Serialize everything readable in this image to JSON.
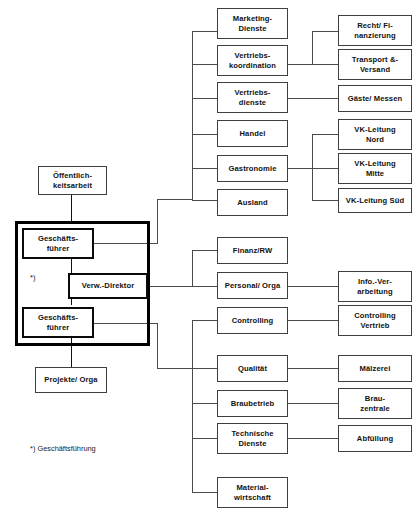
{
  "diagram": {
    "background": "#ffffff",
    "line_color": "#4a4a4a",
    "box_border": "#3f3f3f",
    "emphasis_border": "#000000"
  },
  "left": {
    "public_relations": "Öffentlich-\nkeitsarbeit",
    "managing_director_top": "Geschäfts-\nführer",
    "managing_director_bottom": "Geschäfts-\nführer",
    "admin_director": "Verw.-Direktor",
    "projects": "Projekte/ Orga",
    "footnote_marker": "*)",
    "footnote_text": "*) Geschäftsführung"
  },
  "group_sales": {
    "nodes": [
      {
        "id": "marketing-dienste",
        "label": "Marketing-\nDienste"
      },
      {
        "id": "vertriebskoordination",
        "label": "Vertriebs-\nkoordination"
      },
      {
        "id": "vertriebsdienste",
        "label": "Vertriebs-\ndienste"
      },
      {
        "id": "handel",
        "label": "Handel"
      },
      {
        "id": "gastronomie",
        "label": "Gastronomie"
      },
      {
        "id": "ausland",
        "label": "Ausland"
      }
    ],
    "children": [
      {
        "id": "recht-finanzierung",
        "label": "Recht/ Fi-\nnanzierung"
      },
      {
        "id": "transport-versand",
        "label": "Transport &-\nVersand"
      },
      {
        "id": "gaeste-messen",
        "label": "Gäste/ Messen"
      },
      {
        "id": "vk-leitung-nord",
        "label": "VK-Leitung\nNord"
      },
      {
        "id": "vk-leitung-mitte",
        "label": "VK-Leitung\nMitte"
      },
      {
        "id": "vk-leitung-sued",
        "label": "VK-Leitung Süd"
      }
    ]
  },
  "group_admin": {
    "nodes": [
      {
        "id": "finanz-rw",
        "label": "Finanz/RW"
      },
      {
        "id": "personal-orga",
        "label": "Personal/ Orga"
      },
      {
        "id": "controlling",
        "label": "Controlling"
      }
    ],
    "children": [
      {
        "id": "info-verarbeitung",
        "label": "Info.-Ver-\narbeitung"
      },
      {
        "id": "controlling-vertrieb",
        "label": "Controlling\nVertrieb"
      }
    ]
  },
  "group_production": {
    "nodes": [
      {
        "id": "qualitaet",
        "label": "Qualität"
      },
      {
        "id": "braubetrieb",
        "label": "Braubetrieb"
      },
      {
        "id": "technische-dienste",
        "label": "Technische\nDienste"
      },
      {
        "id": "materialwirtschaft",
        "label": "Material-\nwirtschaft"
      }
    ],
    "children": [
      {
        "id": "maelzerei",
        "label": "Mälzerei"
      },
      {
        "id": "brau-zentrale",
        "label": "Brau-\nzentrale"
      },
      {
        "id": "abfuellung",
        "label": "Abfüllung"
      }
    ]
  }
}
